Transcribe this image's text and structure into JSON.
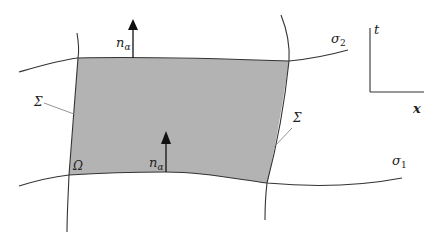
{
  "diagram": {
    "labels": {
      "normal_top": "n",
      "normal_top_sub": "α",
      "normal_bottom": "n",
      "normal_bottom_sub": "α",
      "sigma2": "σ",
      "sigma2_sub": "2",
      "sigma1": "σ",
      "sigma1_sub": "1",
      "boundary_left": "Σ",
      "boundary_right": "Σ",
      "region": "Ω",
      "axis_t": "t",
      "axis_x": "x"
    },
    "colors": {
      "region_fill": "#b3b3b3",
      "stroke": "#333333",
      "leader": "#888888"
    }
  }
}
